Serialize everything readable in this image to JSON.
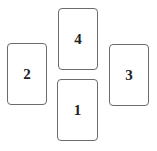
{
  "cards": [
    {
      "id": "card-4",
      "label": "4",
      "x": 58,
      "y": 8,
      "w": 40,
      "h": 62
    },
    {
      "id": "card-2",
      "label": "2",
      "x": 7,
      "y": 43,
      "w": 40,
      "h": 62
    },
    {
      "id": "card-3",
      "label": "3",
      "x": 109,
      "y": 44,
      "w": 40,
      "h": 62
    },
    {
      "id": "card-1",
      "label": "1",
      "x": 57,
      "y": 79,
      "w": 41,
      "h": 62
    }
  ]
}
